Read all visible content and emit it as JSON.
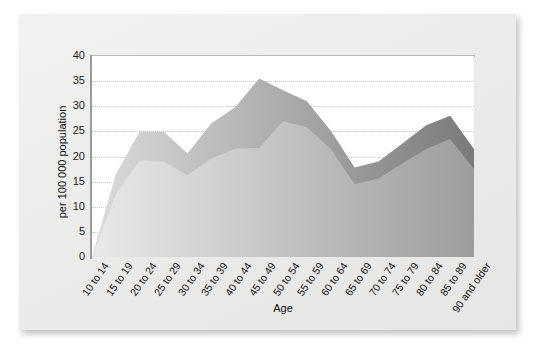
{
  "chart_data": {
    "type": "area",
    "title": "",
    "subtitle": "",
    "xlabel": "Age",
    "ylabel": "per 100 000 population",
    "ylim": [
      0,
      40
    ],
    "yticks": [
      0,
      5,
      10,
      15,
      20,
      25,
      30,
      35,
      40
    ],
    "grid": true,
    "stacked": true,
    "legend_position": "none",
    "categories": [
      "10 to 14",
      "15 to 19",
      "20 to 24",
      "25 to 29",
      "30 to 34",
      "35 to 39",
      "40 to 44",
      "45 to 49",
      "50 to 54",
      "55 to 59",
      "60 to 64",
      "65 to 69",
      "70 to 74",
      "75 to 79",
      "80 to 84",
      "85 to 89",
      "90 and older"
    ],
    "series": [
      {
        "name": "lower-band",
        "values": [
          0,
          12.5,
          19.2,
          19.0,
          16.3,
          19.6,
          21.6,
          21.7,
          27.0,
          25.8,
          21.5,
          14.5,
          15.6,
          18.6,
          21.5,
          23.5,
          17.5
        ]
      },
      {
        "name": "upper-band",
        "values": [
          0,
          4.0,
          5.8,
          6.0,
          4.3,
          7.0,
          8.2,
          13.8,
          6.2,
          5.2,
          3.6,
          3.3,
          3.4,
          4.0,
          4.7,
          4.6,
          4.0
        ]
      }
    ],
    "totals": [
      0,
      16.5,
      25.0,
      25.0,
      20.6,
      26.6,
      29.8,
      35.5,
      33.2,
      31.0,
      25.1,
      17.8,
      19.0,
      22.6,
      26.2,
      28.1,
      21.5
    ],
    "colors": {
      "plot_background": "#ffffff",
      "card_background": "#ececea",
      "page_background": "#ffffff",
      "gridline": "#c9c9c9",
      "axis_line": "#9b9b99",
      "lower_band_start": "#e9e9e9",
      "lower_band_end": "#9c9c9c",
      "upper_band_start": "#dcdcdc",
      "upper_band_end": "#7a7a7a",
      "text": "#111111"
    }
  }
}
